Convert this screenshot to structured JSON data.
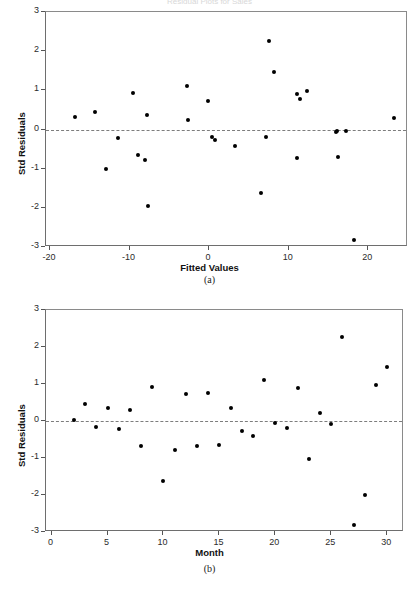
{
  "figure": {
    "cropped_title": "Residual Plots for Sales",
    "captions": {
      "a": "(a)",
      "b": "(b)"
    }
  },
  "chart_data": [
    {
      "panel": "a",
      "type": "scatter",
      "title": "",
      "xlabel": "Fitted Values",
      "ylabel": "Std Residuals",
      "xlim": [
        -20.5,
        25.0
      ],
      "ylim": [
        -3.0,
        3.0
      ],
      "xticks": [
        -20,
        -10,
        0,
        10,
        20
      ],
      "xticklabels": [
        "-20",
        "-10",
        "0",
        "10",
        "20"
      ],
      "yticks": [
        -3,
        -2,
        -1,
        0,
        1,
        2,
        3
      ],
      "yticklabels": [
        "-3",
        "-2",
        "-1",
        "0",
        "1",
        "2",
        "3"
      ],
      "grid": false,
      "legend": "none",
      "reference_line": {
        "y": 0,
        "style": "dashed",
        "color": "#7d7d7d"
      },
      "marker": {
        "shape": "circle",
        "color": "#000000",
        "size": 4
      },
      "x": [
        -16.8,
        -14.3,
        -13.0,
        -11.5,
        -9.6,
        -8.9,
        -8.1,
        -7.8,
        -7.7,
        -2.8,
        -2.6,
        -0.1,
        0.4,
        0.7,
        3.3,
        6.5,
        7.2,
        7.5,
        8.2,
        11.0,
        11.1,
        11.4,
        12.3,
        15.9,
        16.1,
        16.2,
        17.2,
        18.2,
        23.2
      ],
      "y": [
        0.32,
        0.45,
        -1.0,
        -0.21,
        0.93,
        -0.66,
        -0.79,
        0.36,
        -1.96,
        1.12,
        0.23,
        0.74,
        -0.18,
        -0.28,
        -0.41,
        -1.63,
        -0.19,
        2.26,
        1.47,
        0.9,
        -0.72,
        0.77,
        0.98,
        -0.06,
        -0.03,
        -0.71,
        -0.05,
        -2.81,
        0.3
      ]
    },
    {
      "panel": "b",
      "type": "scatter",
      "title": "",
      "xlabel": "Month",
      "ylabel": "Std Residuals",
      "xlim": [
        -0.5,
        31.5
      ],
      "ylim": [
        -3.0,
        3.0
      ],
      "xticks": [
        0,
        5,
        10,
        15,
        20,
        25,
        30
      ],
      "xticklabels": [
        "0",
        "5",
        "10",
        "15",
        "20",
        "25",
        "30"
      ],
      "yticks": [
        -3,
        -2,
        -1,
        0,
        1,
        2,
        3
      ],
      "yticklabels": [
        "-3",
        "-2",
        "-1",
        "0",
        "1",
        "2",
        "3"
      ],
      "grid": false,
      "legend": "none",
      "reference_line": {
        "y": 0,
        "style": "dashed",
        "color": "#7d7d7d"
      },
      "marker": {
        "shape": "circle",
        "color": "#000000",
        "size": 4
      },
      "x": [
        2,
        3,
        4,
        5,
        6,
        7,
        8,
        9,
        10,
        11,
        12,
        13,
        14,
        15,
        16,
        17,
        18,
        19,
        20,
        21,
        22,
        23,
        24,
        25,
        26,
        27,
        28,
        29,
        30
      ],
      "y": [
        0.02,
        0.45,
        -0.17,
        0.35,
        -0.21,
        0.3,
        -0.68,
        0.92,
        -1.63,
        -0.78,
        0.74,
        -0.67,
        0.77,
        -0.66,
        0.35,
        -0.28,
        -0.41,
        1.12,
        -0.06,
        -0.19,
        0.89,
        -1.02,
        0.22,
        -0.08,
        2.26,
        -2.81,
        -1.99,
        0.97,
        1.45
      ]
    }
  ]
}
